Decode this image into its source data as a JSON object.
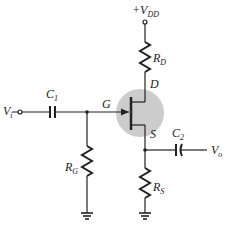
{
  "diagram": {
    "type": "JFET common-drain / self-bias amplifier circuit",
    "colors": {
      "wire": "#222222",
      "transistor_highlight": "#cccccc"
    },
    "labels": {
      "vdd": {
        "main": "+V",
        "sub": "DD"
      },
      "rd": {
        "main": "R",
        "sub": "D"
      },
      "drain": "D",
      "gate": "G",
      "source": "S",
      "c1": {
        "main": "C",
        "sub": "1"
      },
      "c2": {
        "main": "C",
        "sub": "2"
      },
      "vi": {
        "main": "V",
        "sub": "i"
      },
      "vo": {
        "main": "V",
        "sub": "o"
      },
      "rg": {
        "main": "R",
        "sub": "G"
      },
      "rs": {
        "main": "R",
        "sub": "S"
      }
    }
  }
}
